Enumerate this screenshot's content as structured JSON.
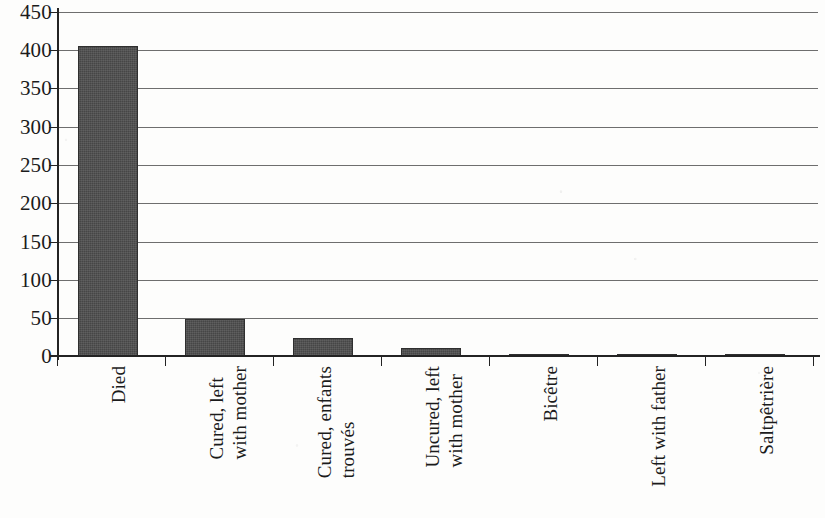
{
  "chart_data": {
    "type": "bar",
    "title": "",
    "subtitle": "",
    "xlabel": "",
    "ylabel": "",
    "ylim": [
      0,
      450
    ],
    "ytick_step": 50,
    "ytick_labels": [
      "450",
      "400",
      "350",
      "300",
      "250",
      "200",
      "150",
      "100",
      "50",
      "0"
    ],
    "ytick_values": [
      450,
      400,
      350,
      300,
      250,
      200,
      150,
      100,
      50,
      0
    ],
    "grid": true,
    "grid_axis": "y",
    "legend": false,
    "legend_position": "none",
    "bar_color": "#4d4d4d",
    "axis_color": "#232323",
    "grid_color": "#6e6e6e",
    "categories": [
      "Died",
      "Cured, left with mother",
      "Cured, enfants trouvés",
      "Uncured, left with mother",
      "Bicêtre",
      "Left with father",
      "Saltpêtrière"
    ],
    "category_lines": [
      [
        "Died"
      ],
      [
        "Cured, left",
        "with mother"
      ],
      [
        "Cured, enfants",
        "trouvés"
      ],
      [
        "Uncured, left",
        "with mother"
      ],
      [
        "Bicêtre"
      ],
      [
        "Left with father"
      ],
      [
        "Saltpêtrière"
      ]
    ],
    "values": [
      406,
      48,
      24,
      10,
      2,
      1,
      1
    ]
  }
}
